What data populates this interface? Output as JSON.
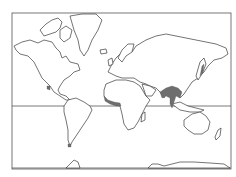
{
  "map": {
    "projection": "Mercator",
    "type": "world distribution map",
    "colors": {
      "background": "#ffffff",
      "coastline": "#3a3a3a",
      "frame": "#555555",
      "range_fill": "#6e6e6e"
    },
    "lines": [
      {
        "name": "equator",
        "y": 106
      },
      {
        "name": "southern-boundary",
        "y": 168
      }
    ],
    "highlighted_regions": [
      {
        "name": "west-africa-coast",
        "description": "Gulf of Guinea coastal belt, West Africa"
      },
      {
        "name": "south-southeast-asia",
        "description": "Eastern India, Indochina, Malay Peninsula to Sumatra"
      },
      {
        "name": "japan",
        "description": "Japan (shaded strip)"
      },
      {
        "name": "central-america",
        "description": "Southern Mexico / Central America (small mark)"
      },
      {
        "name": "tierra-del-fuego",
        "description": "Southern tip of South America (small mark)"
      }
    ]
  }
}
